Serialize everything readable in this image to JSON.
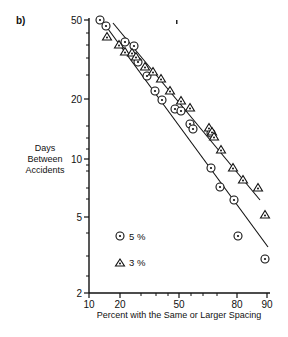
{
  "panel_label": "b)",
  "y_axis": {
    "label_lines": [
      "Days",
      "Between",
      "Accidents"
    ],
    "scale": "log",
    "ticks": [
      {
        "value": 50,
        "label": "50",
        "y": 20
      },
      {
        "value": 20,
        "label": "20",
        "y": 99
      },
      {
        "value": 10,
        "label": "10",
        "y": 159
      },
      {
        "value": 5,
        "label": "5",
        "y": 217
      },
      {
        "value": 2,
        "label": "2",
        "y": 293
      }
    ],
    "minor_ticks_y": [
      33,
      45,
      58,
      75,
      126,
      138,
      149,
      165,
      171,
      188,
      199,
      233,
      256,
      276
    ]
  },
  "x_axis": {
    "label": "Percent with the Same or Larger Spacing",
    "scale": "probability",
    "ticks": [
      {
        "value": 10,
        "label": "10",
        "x": 89
      },
      {
        "value": 20,
        "label": "20",
        "x": 120
      },
      {
        "value": 50,
        "label": "50",
        "x": 179
      },
      {
        "value": 80,
        "label": "80",
        "x": 237
      },
      {
        "value": 90,
        "label": "90",
        "x": 267
      }
    ],
    "minor_ticks_x": [
      141,
      156,
      168,
      191,
      203,
      217
    ]
  },
  "legend": [
    {
      "symbol": "circle-dot",
      "label": "5 %"
    },
    {
      "symbol": "triangle-dot",
      "label": "3 %"
    }
  ],
  "chart_data": {
    "type": "scatter",
    "title": "",
    "panel": "b)",
    "xlabel": "Percent with the Same or Larger Spacing",
    "ylabel": "Days Between Accidents",
    "xscale": "probability",
    "yscale": "log",
    "xlim": [
      10,
      90
    ],
    "ylim": [
      2,
      50
    ],
    "grid": false,
    "legend_position": "lower left inside",
    "series": [
      {
        "name": "5 %",
        "marker": "circle with center dot",
        "points": [
          [
            13,
            50
          ],
          [
            15,
            47
          ],
          [
            21,
            38
          ],
          [
            24,
            36
          ],
          [
            26,
            30
          ],
          [
            30,
            26
          ],
          [
            34,
            22
          ],
          [
            37,
            20
          ],
          [
            43,
            18
          ],
          [
            46,
            17.5
          ],
          [
            51,
            15
          ],
          [
            53,
            14
          ],
          [
            62,
            13
          ],
          [
            62,
            9
          ],
          [
            67,
            7.8
          ],
          [
            75,
            6.6
          ],
          [
            78,
            4.2
          ],
          [
            89,
            3.1
          ]
        ],
        "pixel_points": [
          [
            100,
            20
          ],
          [
            106,
            26
          ],
          [
            125,
            42
          ],
          [
            134,
            46
          ],
          [
            138,
            62
          ],
          [
            147,
            76
          ],
          [
            155,
            91
          ],
          [
            162,
            100
          ],
          [
            175,
            109
          ],
          [
            181,
            111
          ],
          [
            190,
            124
          ],
          [
            193,
            129
          ],
          [
            211,
            133
          ],
          [
            211,
            168
          ],
          [
            220,
            187
          ],
          [
            234,
            200
          ],
          [
            238,
            236
          ],
          [
            265,
            259
          ]
        ],
        "fit_line": {
          "from": [
            10,
            50
          ],
          "to": [
            90,
            3.5
          ],
          "pixel_from": [
            100,
            18
          ],
          "pixel_to": [
            268,
            247
          ]
        }
      },
      {
        "name": "3 %",
        "marker": "triangle with center dot",
        "points": [
          [
            15,
            42
          ],
          [
            19,
            38
          ],
          [
            21,
            35
          ],
          [
            24,
            35
          ],
          [
            25,
            33
          ],
          [
            29,
            29
          ],
          [
            32,
            27
          ],
          [
            36,
            25
          ],
          [
            41,
            21
          ],
          [
            46,
            19
          ],
          [
            51,
            17.5
          ],
          [
            61,
            14
          ],
          [
            63,
            13.5
          ],
          [
            64,
            13
          ],
          [
            68,
            11.5
          ],
          [
            74,
            9.5
          ],
          [
            78,
            8.5
          ],
          [
            85,
            7.5
          ],
          [
            89,
            5
          ]
        ],
        "pixel_points": [
          [
            107,
            37
          ],
          [
            119,
            45
          ],
          [
            125,
            52
          ],
          [
            132,
            53
          ],
          [
            136,
            57
          ],
          [
            145,
            67
          ],
          [
            153,
            72
          ],
          [
            161,
            79
          ],
          [
            170,
            91
          ],
          [
            181,
            101
          ],
          [
            190,
            108
          ],
          [
            209,
            128
          ],
          [
            212,
            132
          ],
          [
            214,
            137
          ],
          [
            221,
            150
          ],
          [
            233,
            168
          ],
          [
            243,
            180
          ],
          [
            258,
            188
          ],
          [
            265,
            215
          ]
        ],
        "fit_line": {
          "from": [
            15,
            47
          ],
          "to": [
            88,
            6.3
          ],
          "pixel_from": [
            113,
            23
          ],
          "pixel_to": [
            260,
            200
          ]
        }
      }
    ]
  }
}
